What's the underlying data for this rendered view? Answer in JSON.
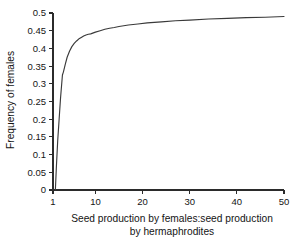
{
  "chart_data": {
    "type": "line",
    "title": "",
    "subtitle": "",
    "xlabel_line1": "Seed production by females:seed production",
    "xlabel_line2": "by hermaphrodites",
    "xlabel": "Seed production by females:seed production by hermaphrodites",
    "ylabel": "Frequency of females",
    "xlim": [
      1,
      50
    ],
    "ylim": [
      0,
      0.5
    ],
    "xticks": [
      1,
      10,
      20,
      30,
      40,
      50
    ],
    "xtick_labels": [
      "1",
      "10",
      "20",
      "30",
      "40",
      "50"
    ],
    "yticks": [
      0,
      0.05,
      0.1,
      0.15,
      0.2,
      0.25,
      0.3,
      0.35,
      0.4,
      0.45,
      0.5
    ],
    "ytick_labels": [
      "0",
      "0.05",
      "0.1",
      "0.15",
      "0.2",
      "0.25",
      "0.3",
      "0.35",
      "0.4",
      "0.45",
      "0.5"
    ],
    "grid": false,
    "legend": null,
    "legend_position": "none",
    "line_color": "#3a3a3a",
    "axis_color": "#2b2b2b",
    "background_color": "#ffffff",
    "series": [
      {
        "name": "Frequency of females",
        "x": [
          1.5,
          1.7,
          2.0,
          2.3,
          2.6,
          3.0,
          3.2,
          3.6,
          4.0,
          4.5,
          5.0,
          5.5,
          6.0,
          6.5,
          7.0,
          7.5,
          8.0,
          8.5,
          9.0,
          10.0,
          11.0,
          12.0,
          13.0,
          14.0,
          15.0,
          17.0,
          19.0,
          21.0,
          24.0,
          27.0,
          30.0,
          34.0,
          38.0,
          42.0,
          46.0,
          50.0
        ],
        "y": [
          0.0,
          0.06,
          0.14,
          0.2,
          0.26,
          0.325,
          0.333,
          0.355,
          0.375,
          0.392,
          0.405,
          0.414,
          0.421,
          0.427,
          0.431,
          0.435,
          0.438,
          0.44,
          0.441,
          0.446,
          0.45,
          0.454,
          0.457,
          0.459,
          0.462,
          0.466,
          0.469,
          0.472,
          0.475,
          0.478,
          0.48,
          0.483,
          0.485,
          0.487,
          0.488,
          0.49
        ]
      }
    ],
    "annotations": []
  }
}
